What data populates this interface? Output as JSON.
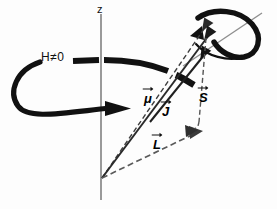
{
  "figure": {
    "background_color": "#fdfdfd",
    "ink_color": "#111111",
    "axis_color": "#8a8a8a",
    "dash_color": "#4a4a4a"
  },
  "axis": {
    "z_label": "z",
    "name": "vertical-axis"
  },
  "field": {
    "label": "H≠0",
    "description": "external magnetic field non-zero"
  },
  "vectors": [
    {
      "id": "mu",
      "label": "μ",
      "accent": "arrow",
      "style": "dashed",
      "description": "magnetic moment vector"
    },
    {
      "id": "j",
      "label": "J",
      "accent": "arrow",
      "style": "solid",
      "description": "total angular momentum vector"
    },
    {
      "id": "s",
      "label": "S",
      "accent": "arrow",
      "style": "dashed",
      "description": "spin angular momentum vector"
    },
    {
      "id": "l",
      "label": "L",
      "accent": "arrow",
      "style": "dashed",
      "description": "orbital angular momentum vector"
    }
  ],
  "precession": {
    "large_arc_name": "larmor-precession-arc",
    "small_loop_name": "spin-precession-loop",
    "tilted_axis_name": "precession-axis-line"
  }
}
